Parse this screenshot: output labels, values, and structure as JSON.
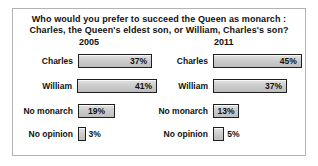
{
  "figure": {
    "title_line1": "Who would you prefer to succeed the Queen as monarch :",
    "title_line2": "Charles, the Queen's eldest son, or William, Charles's son?"
  },
  "chart_data": {
    "type": "bar",
    "orientation": "horizontal",
    "title": "Who would you prefer to succeed the Queen as monarch : Charles, the Queen's eldest son, or William, Charles's son?",
    "categories": [
      "Charles",
      "William",
      "No monarch",
      "No opinion"
    ],
    "series": [
      {
        "name": "2005",
        "values": [
          37,
          41,
          19,
          3
        ]
      },
      {
        "name": "2011",
        "values": [
          45,
          37,
          13,
          5
        ]
      }
    ],
    "unit": "%",
    "xlim": [
      0,
      50
    ],
    "value_labels": true,
    "legend_position": "column-headers",
    "grid": false,
    "colors": {
      "bar_fill": "#c8c8c8",
      "bar_border": "#1f1f1f",
      "frame_border": "#b3b3b3",
      "text": "#111111",
      "background": "#ffffff"
    },
    "panels": [
      {
        "year": "2005",
        "rows": [
          {
            "category": "Charles",
            "value": 37,
            "label": "37%"
          },
          {
            "category": "William",
            "value": 41,
            "label": "41%"
          },
          {
            "category": "No monarch",
            "value": 19,
            "label": "19%"
          },
          {
            "category": "No opinion",
            "value": 3,
            "label": "3%"
          }
        ]
      },
      {
        "year": "2011",
        "rows": [
          {
            "category": "Charles",
            "value": 45,
            "label": "45%"
          },
          {
            "category": "William",
            "value": 37,
            "label": "37%"
          },
          {
            "category": "No monarch",
            "value": 13,
            "label": "13%"
          },
          {
            "category": "No opinion",
            "value": 5,
            "label": "5%"
          }
        ]
      }
    ]
  }
}
